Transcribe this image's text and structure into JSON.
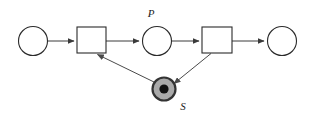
{
  "diagram": {
    "type": "petri-net",
    "background_color": "#ffffff",
    "stroke_color": "#2b2b2b",
    "arc_color": "#3a3a3a",
    "marked_place_fill": "#a9a9a9",
    "token_color": "#111111",
    "width": 310,
    "height": 122,
    "places": [
      {
        "id": "place-input",
        "label": "",
        "cx": 33,
        "cy": 41,
        "r": 14.5,
        "marked": false,
        "tokens": 0
      },
      {
        "id": "place-p",
        "label": "P",
        "label_x": 151,
        "label_y": 17,
        "cx": 157,
        "cy": 41,
        "r": 14.5,
        "marked": false,
        "tokens": 0
      },
      {
        "id": "place-output",
        "label": "",
        "cx": 282,
        "cy": 41,
        "r": 14.5,
        "marked": false,
        "tokens": 0
      },
      {
        "id": "place-s",
        "label": "S",
        "label_x": 183,
        "label_y": 110,
        "cx": 164,
        "cy": 89,
        "r": 12,
        "marked": true,
        "tokens": 1,
        "token_r": 4.6
      }
    ],
    "transitions": [
      {
        "id": "transition-left",
        "label": "",
        "x": 77,
        "y": 27,
        "width": 29,
        "height": 26
      },
      {
        "id": "transition-right",
        "label": "",
        "x": 202,
        "y": 27,
        "width": 30,
        "height": 26
      }
    ],
    "arcs": [
      {
        "id": "arc-input-to-left-transition",
        "from": "place-input",
        "to": "transition-left",
        "x1": 48,
        "y1": 41,
        "x2": 76,
        "y2": 41,
        "arrowhead": true
      },
      {
        "id": "arc-left-transition-to-p",
        "from": "transition-left",
        "to": "place-p",
        "x1": 106,
        "y1": 41,
        "x2": 141,
        "y2": 41,
        "arrowhead": true
      },
      {
        "id": "arc-p-to-right-transition",
        "from": "place-p",
        "to": "transition-right",
        "x1": 172,
        "y1": 41,
        "x2": 201,
        "y2": 41,
        "arrowhead": true
      },
      {
        "id": "arc-right-transition-to-output",
        "from": "transition-right",
        "to": "place-output",
        "x1": 232,
        "y1": 41,
        "x2": 266,
        "y2": 41,
        "arrowhead": true
      },
      {
        "id": "arc-s-to-left-transition",
        "from": "place-s",
        "to": "transition-left",
        "x1": 154,
        "y1": 82,
        "x2": 95,
        "y2": 53,
        "arrowhead": true
      },
      {
        "id": "arc-right-transition-to-s",
        "from": "transition-right",
        "to": "place-s",
        "x1": 211,
        "y1": 53,
        "x2": 175,
        "y2": 83,
        "arrowhead": true
      }
    ]
  }
}
